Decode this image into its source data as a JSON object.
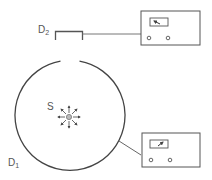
{
  "diagram": {
    "labels": {
      "detector_top": "D",
      "detector_top_sub": "2",
      "detector_ring": "D",
      "detector_ring_sub": "1",
      "source": "S"
    },
    "colors": {
      "stroke": "#444444",
      "meter_stroke": "#555555",
      "source_fill": "#bbbbbb"
    },
    "meters": [
      {
        "id": "meter-d2",
        "needle": "left-pointing"
      },
      {
        "id": "meter-d1",
        "needle": "right-pointing"
      }
    ]
  }
}
